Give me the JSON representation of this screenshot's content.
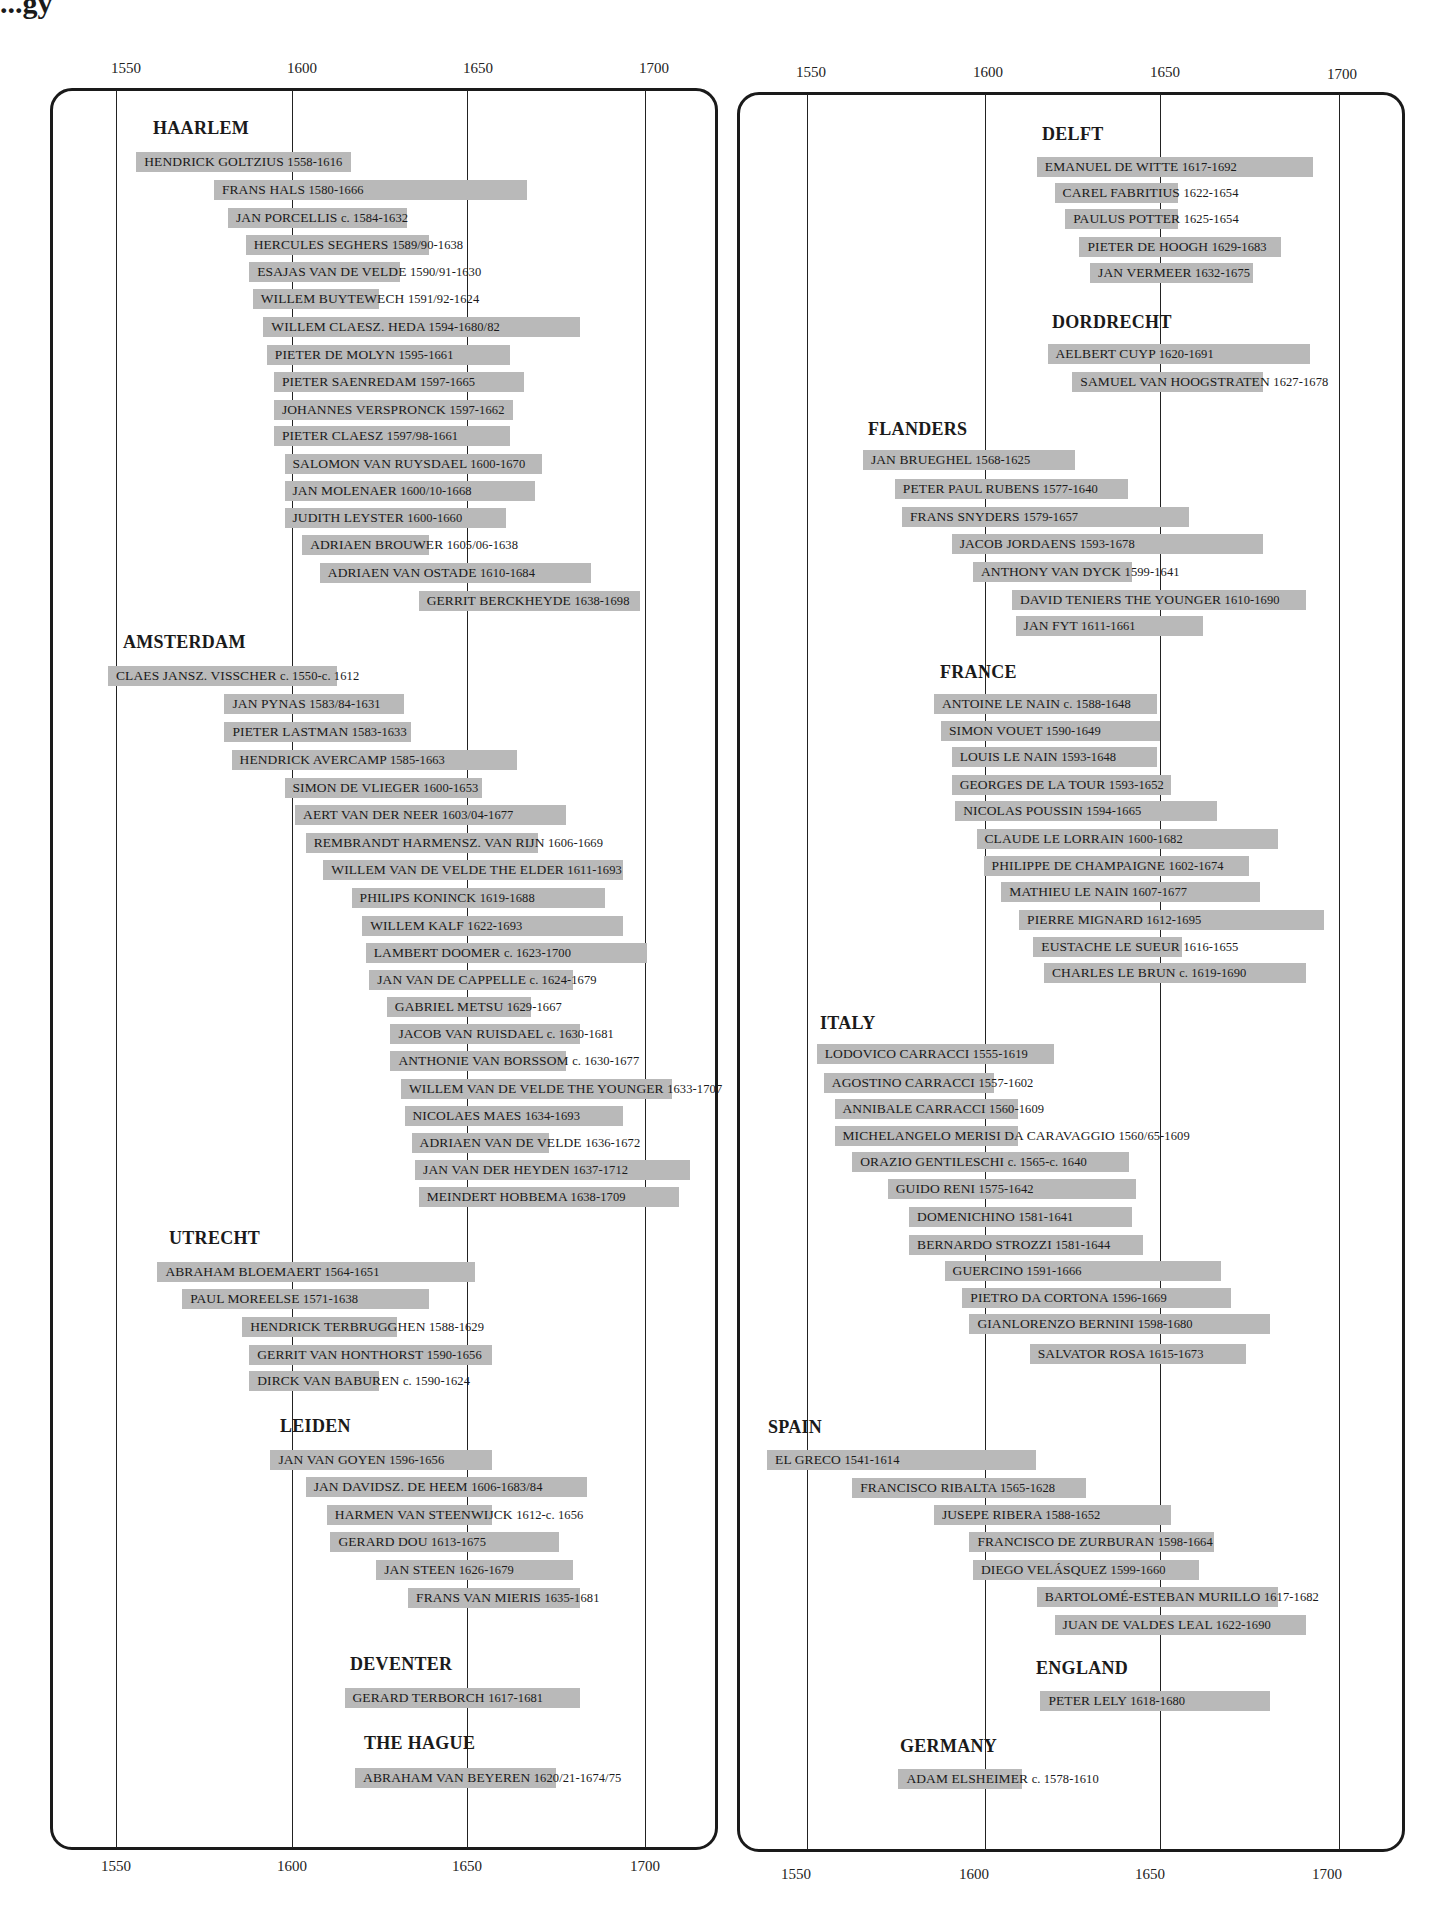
{
  "title_fragment": "...gy",
  "axis": {
    "ticks": [
      "1550",
      "1600",
      "1650",
      "1700"
    ]
  },
  "chart_data": {
    "type": "table",
    "xlabel": "Year",
    "xlim": [
      1535,
      1715
    ],
    "x_ticks": [
      1550,
      1600,
      1650,
      1700
    ],
    "grid": true,
    "panels": [
      {
        "name": "left",
        "groups": [
          {
            "school": "HAARLEM",
            "painters": [
              {
                "name": "HENDRICK GOLTZIUS",
                "dates": "1558-1616",
                "start": 1558,
                "end": 1616
              },
              {
                "name": "FRANS HALS",
                "dates": "1580-1666",
                "start": 1580,
                "end": 1666
              },
              {
                "name": "JAN PORCELLIS",
                "dates": "c. 1584-1632",
                "start": 1584,
                "end": 1632
              },
              {
                "name": "HERCULES SEGHERS",
                "dates": "1589/90-1638",
                "start": 1589,
                "end": 1638
              },
              {
                "name": "ESAJAS VAN DE VELDE",
                "dates": "1590/91-1630",
                "start": 1590,
                "end": 1630
              },
              {
                "name": "WILLEM BUYTEWECH",
                "dates": "1591/92-1624",
                "start": 1591,
                "end": 1624
              },
              {
                "name": "WILLEM CLAESZ. HEDA",
                "dates": "1594-1680/82",
                "start": 1594,
                "end": 1681
              },
              {
                "name": "PIETER DE MOLYN",
                "dates": "1595-1661",
                "start": 1595,
                "end": 1661
              },
              {
                "name": "PIETER SAENREDAM",
                "dates": "1597-1665",
                "start": 1597,
                "end": 1665
              },
              {
                "name": "JOHANNES VERSPRONCK",
                "dates": "1597-1662",
                "start": 1597,
                "end": 1662
              },
              {
                "name": "PIETER CLAESZ",
                "dates": "1597/98-1661",
                "start": 1597,
                "end": 1661
              },
              {
                "name": "SALOMON VAN RUYSDAEL",
                "dates": "1600-1670",
                "start": 1600,
                "end": 1670
              },
              {
                "name": "JAN MOLENAER",
                "dates": "1600/10-1668",
                "start": 1600,
                "end": 1668
              },
              {
                "name": "JUDITH LEYSTER",
                "dates": "1600-1660",
                "start": 1600,
                "end": 1660
              },
              {
                "name": "ADRIAEN BROUWER",
                "dates": "1605/06-1638",
                "start": 1605,
                "end": 1638
              },
              {
                "name": "ADRIAEN VAN OSTADE",
                "dates": "1610-1684",
                "start": 1610,
                "end": 1684
              },
              {
                "name": "GERRIT BERCKHEYDE",
                "dates": "1638-1698",
                "start": 1638,
                "end": 1698
              }
            ]
          },
          {
            "school": "AMSTERDAM",
            "painters": [
              {
                "name": "CLAES JANSZ. VISSCHER",
                "dates": "c. 1550-c. 1612",
                "start": 1550,
                "end": 1612
              },
              {
                "name": "JAN PYNAS",
                "dates": "1583/84-1631",
                "start": 1583,
                "end": 1631
              },
              {
                "name": "PIETER LASTMAN",
                "dates": "1583-1633",
                "start": 1583,
                "end": 1633
              },
              {
                "name": "HENDRICK AVERCAMP",
                "dates": "1585-1663",
                "start": 1585,
                "end": 1663
              },
              {
                "name": "SIMON DE VLIEGER",
                "dates": "1600-1653",
                "start": 1600,
                "end": 1653
              },
              {
                "name": "AERT VAN DER NEER",
                "dates": "1603/04-1677",
                "start": 1603,
                "end": 1677
              },
              {
                "name": "REMBRANDT HARMENSZ. VAN RIJN",
                "dates": "1606-1669",
                "start": 1606,
                "end": 1669
              },
              {
                "name": "WILLEM VAN DE VELDE THE ELDER",
                "dates": "1611-1693",
                "start": 1611,
                "end": 1693
              },
              {
                "name": "PHILIPS KONINCK",
                "dates": "1619-1688",
                "start": 1619,
                "end": 1688
              },
              {
                "name": "WILLEM KALF",
                "dates": "1622-1693",
                "start": 1622,
                "end": 1693
              },
              {
                "name": "LAMBERT DOOMER",
                "dates": "c. 1623-1700",
                "start": 1623,
                "end": 1700
              },
              {
                "name": "JAN VAN DE CAPPELLE",
                "dates": "c. 1624-1679",
                "start": 1624,
                "end": 1679
              },
              {
                "name": "GABRIEL METSU",
                "dates": "1629-1667",
                "start": 1629,
                "end": 1667
              },
              {
                "name": "JACOB VAN RUISDAEL",
                "dates": "c. 1630-1681",
                "start": 1630,
                "end": 1681
              },
              {
                "name": "ANTHONIE VAN BORSSOM",
                "dates": "c. 1630-1677",
                "start": 1630,
                "end": 1677
              },
              {
                "name": "WILLEM VAN DE VELDE THE YOUNGER",
                "dates": "1633-1707",
                "start": 1633,
                "end": 1707
              },
              {
                "name": "NICOLAES MAES",
                "dates": "1634-1693",
                "start": 1634,
                "end": 1693
              },
              {
                "name": "ADRIAEN VAN DE VELDE",
                "dates": "1636-1672",
                "start": 1636,
                "end": 1672
              },
              {
                "name": "JAN VAN DER HEYDEN",
                "dates": "1637-1712",
                "start": 1637,
                "end": 1712
              },
              {
                "name": "MEINDERT HOBBEMA",
                "dates": "1638-1709",
                "start": 1638,
                "end": 1709
              }
            ]
          },
          {
            "school": "UTRECHT",
            "painters": [
              {
                "name": "ABRAHAM BLOEMAERT",
                "dates": "1564-1651",
                "start": 1564,
                "end": 1651
              },
              {
                "name": "PAUL MOREELSE",
                "dates": "1571-1638",
                "start": 1571,
                "end": 1638
              },
              {
                "name": "HENDRICK TERBRUGGHEN",
                "dates": "1588-1629",
                "start": 1588,
                "end": 1629
              },
              {
                "name": "GERRIT VAN HONTHORST",
                "dates": "1590-1656",
                "start": 1590,
                "end": 1656
              },
              {
                "name": "DIRCK VAN BABUREN",
                "dates": "c. 1590-1624",
                "start": 1590,
                "end": 1624
              }
            ]
          },
          {
            "school": "LEIDEN",
            "painters": [
              {
                "name": "JAN VAN GOYEN",
                "dates": "1596-1656",
                "start": 1596,
                "end": 1656
              },
              {
                "name": "JAN DAVIDSZ. DE HEEM",
                "dates": "1606-1683/84",
                "start": 1606,
                "end": 1683
              },
              {
                "name": "HARMEN VAN STEENWIJCK",
                "dates": "1612-c. 1656",
                "start": 1612,
                "end": 1656
              },
              {
                "name": "GERARD DOU",
                "dates": "1613-1675",
                "start": 1613,
                "end": 1675
              },
              {
                "name": "JAN STEEN",
                "dates": "1626-1679",
                "start": 1626,
                "end": 1679
              },
              {
                "name": "FRANS VAN MIERIS",
                "dates": "1635-1681",
                "start": 1635,
                "end": 1681
              }
            ]
          },
          {
            "school": "DEVENTER",
            "painters": [
              {
                "name": "GERARD TERBORCH",
                "dates": "1617-1681",
                "start": 1617,
                "end": 1681
              }
            ]
          },
          {
            "school": "THE HAGUE",
            "painters": [
              {
                "name": "ABRAHAM VAN BEYEREN",
                "dates": "1620/21-1674/75",
                "start": 1620,
                "end": 1674
              }
            ]
          }
        ]
      },
      {
        "name": "right",
        "groups": [
          {
            "school": "DELFT",
            "painters": [
              {
                "name": "EMANUEL DE WITTE",
                "dates": "1617-1692",
                "start": 1617,
                "end": 1692
              },
              {
                "name": "CAREL FABRITIUS",
                "dates": "1622-1654",
                "start": 1622,
                "end": 1654
              },
              {
                "name": "PAULUS POTTER",
                "dates": "1625-1654",
                "start": 1625,
                "end": 1654
              },
              {
                "name": "PIETER DE HOOGH",
                "dates": "1629-1683",
                "start": 1629,
                "end": 1683
              },
              {
                "name": "JAN VERMEER",
                "dates": "1632-1675",
                "start": 1632,
                "end": 1675
              }
            ]
          },
          {
            "school": "DORDRECHT",
            "painters": [
              {
                "name": "AELBERT CUYP",
                "dates": "1620-1691",
                "start": 1620,
                "end": 1691
              },
              {
                "name": "SAMUEL VAN HOOGSTRATEN",
                "dates": "1627-1678",
                "start": 1627,
                "end": 1678
              }
            ]
          },
          {
            "school": "FLANDERS",
            "painters": [
              {
                "name": "JAN BRUEGHEL",
                "dates": "1568-1625",
                "start": 1568,
                "end": 1625
              },
              {
                "name": "PETER PAUL RUBENS",
                "dates": "1577-1640",
                "start": 1577,
                "end": 1640
              },
              {
                "name": "FRANS SNYDERS",
                "dates": "1579-1657",
                "start": 1579,
                "end": 1657
              },
              {
                "name": "JACOB JORDAENS",
                "dates": "1593-1678",
                "start": 1593,
                "end": 1678
              },
              {
                "name": "ANTHONY VAN DYCK",
                "dates": "1599-1641",
                "start": 1599,
                "end": 1641
              },
              {
                "name": "DAVID TENIERS THE YOUNGER",
                "dates": "1610-1690",
                "start": 1610,
                "end": 1690
              },
              {
                "name": "JAN FYT",
                "dates": "1611-1661",
                "start": 1611,
                "end": 1661
              }
            ]
          },
          {
            "school": "FRANCE",
            "painters": [
              {
                "name": "ANTOINE LE NAIN",
                "dates": "c. 1588-1648",
                "start": 1588,
                "end": 1648
              },
              {
                "name": "SIMON VOUET",
                "dates": "1590-1649",
                "start": 1590,
                "end": 1649
              },
              {
                "name": "LOUIS LE NAIN",
                "dates": "1593-1648",
                "start": 1593,
                "end": 1648
              },
              {
                "name": "GEORGES DE LA TOUR",
                "dates": "1593-1652",
                "start": 1593,
                "end": 1652
              },
              {
                "name": "NICOLAS POUSSIN",
                "dates": "1594-1665",
                "start": 1594,
                "end": 1665
              },
              {
                "name": "CLAUDE LE LORRAIN",
                "dates": "1600-1682",
                "start": 1600,
                "end": 1682
              },
              {
                "name": "PHILIPPE DE CHAMPAIGNE",
                "dates": "1602-1674",
                "start": 1602,
                "end": 1674
              },
              {
                "name": "MATHIEU LE NAIN",
                "dates": "1607-1677",
                "start": 1607,
                "end": 1677
              },
              {
                "name": "PIERRE MIGNARD",
                "dates": "1612-1695",
                "start": 1612,
                "end": 1695
              },
              {
                "name": "EUSTACHE LE SUEUR",
                "dates": "1616-1655",
                "start": 1616,
                "end": 1655
              },
              {
                "name": "CHARLES LE BRUN",
                "dates": "c. 1619-1690",
                "start": 1619,
                "end": 1690
              }
            ]
          },
          {
            "school": "ITALY",
            "painters": [
              {
                "name": "LODOVICO CARRACCI",
                "dates": "1555-1619",
                "start": 1555,
                "end": 1619
              },
              {
                "name": "AGOSTINO CARRACCI",
                "dates": "1557-1602",
                "start": 1557,
                "end": 1602
              },
              {
                "name": "ANNIBALE CARRACCI",
                "dates": "1560-1609",
                "start": 1560,
                "end": 1609
              },
              {
                "name": "MICHELANGELO MERISI DA CARAVAGGIO",
                "dates": "1560/65-1609",
                "start": 1560,
                "end": 1609
              },
              {
                "name": "ORAZIO GENTILESCHI",
                "dates": "c. 1565-c. 1640",
                "start": 1565,
                "end": 1640
              },
              {
                "name": "GUIDO RENI",
                "dates": "1575-1642",
                "start": 1575,
                "end": 1642
              },
              {
                "name": "DOMENICHINO",
                "dates": "1581-1641",
                "start": 1581,
                "end": 1641
              },
              {
                "name": "BERNARDO STROZZI",
                "dates": "1581-1644",
                "start": 1581,
                "end": 1644
              },
              {
                "name": "GUERCINO",
                "dates": "1591-1666",
                "start": 1591,
                "end": 1666
              },
              {
                "name": "PIETRO DA CORTONA",
                "dates": "1596-1669",
                "start": 1596,
                "end": 1669
              },
              {
                "name": "GIANLORENZO BERNINI",
                "dates": "1598-1680",
                "start": 1598,
                "end": 1680
              },
              {
                "name": "SALVATOR ROSA",
                "dates": "1615-1673",
                "start": 1615,
                "end": 1673
              }
            ]
          },
          {
            "school": "SPAIN",
            "painters": [
              {
                "name": "EL GRECO",
                "dates": "1541-1614",
                "start": 1541,
                "end": 1614
              },
              {
                "name": "FRANCISCO RIBALTA",
                "dates": "1565-1628",
                "start": 1565,
                "end": 1628
              },
              {
                "name": "JUSEPE RIBERA",
                "dates": "1588-1652",
                "start": 1588,
                "end": 1652
              },
              {
                "name": "FRANCISCO DE ZURBURAN",
                "dates": "1598-1664",
                "start": 1598,
                "end": 1664
              },
              {
                "name": "DIEGO VELÁSQUEZ",
                "dates": "1599-1660",
                "start": 1599,
                "end": 1660
              },
              {
                "name": "BARTOLOMÉ-ESTEBAN MURILLO",
                "dates": "1617-1682",
                "start": 1617,
                "end": 1682
              },
              {
                "name": "JUAN DE VALDES LEAL",
                "dates": "1622-1690",
                "start": 1622,
                "end": 1690
              }
            ]
          },
          {
            "school": "ENGLAND",
            "painters": [
              {
                "name": "PETER LELY",
                "dates": "1618-1680",
                "start": 1618,
                "end": 1680
              }
            ]
          },
          {
            "school": "GERMANY",
            "painters": [
              {
                "name": "ADAM ELSHEIMER",
                "dates": "c. 1578-1610",
                "start": 1578,
                "end": 1610
              }
            ]
          }
        ]
      }
    ]
  },
  "colors": {
    "bar": "#b9b9b9",
    "line": "#222222",
    "frame": "#1a1a1a"
  }
}
